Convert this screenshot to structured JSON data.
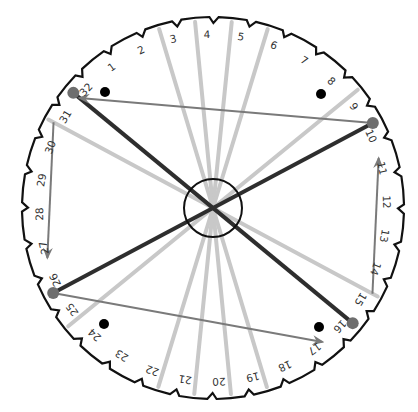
{
  "diagram": {
    "center": {
      "x": 213,
      "y": 208
    },
    "outer_radius": 191,
    "point_radius": 181,
    "label_radius": 173,
    "hub_radius": 29,
    "label_count": 32,
    "angle_of_label_10_deg": -28,
    "step_deg": 11.25,
    "labels": [
      "1",
      "2",
      "3",
      "4",
      "5",
      "6",
      "7",
      "8",
      "9",
      "10",
      "11",
      "12",
      "13",
      "14",
      "15",
      "16",
      "17",
      "18",
      "19",
      "20",
      "21",
      "22",
      "23",
      "24",
      "25",
      "26",
      "27",
      "28",
      "29",
      "30",
      "31",
      "32"
    ],
    "colors": {
      "outline": "#111111",
      "thick_line": "#2e2e2e",
      "arrow": "#7a7a7a",
      "fan_line": "#c8c8c8",
      "node": "#6e6e6e",
      "dot": "#000000",
      "label": "#333333"
    },
    "fan_lines_to": [
      3,
      4,
      5,
      6,
      19,
      20,
      21,
      22,
      9,
      25,
      31,
      15
    ],
    "thick_lines": [
      {
        "from": 32,
        "to": 16
      },
      {
        "from": 10,
        "to": 26
      }
    ],
    "arrows": [
      {
        "from": 10,
        "to": 32
      },
      {
        "from": 31,
        "to": 27
      },
      {
        "from": 26,
        "to": 17
      },
      {
        "from": 15,
        "to": 11
      }
    ],
    "nodes": [
      32,
      10,
      26,
      16
    ],
    "dots": [
      {
        "x": 105,
        "y": 92
      },
      {
        "x": 321,
        "y": 94
      },
      {
        "x": 104,
        "y": 324
      },
      {
        "x": 319,
        "y": 327
      }
    ]
  }
}
